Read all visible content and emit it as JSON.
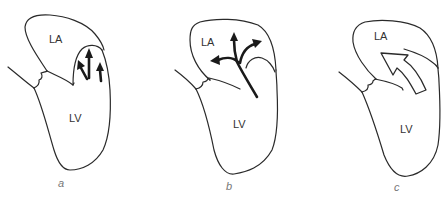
{
  "figure": {
    "panels": [
      {
        "id": "a",
        "panel_label": "a",
        "chamber_labels": {
          "atrium": "LA",
          "ventricle": "LV"
        },
        "flow_depiction": "three short arrows in regurgitant pocket"
      },
      {
        "id": "b",
        "panel_label": "b",
        "chamber_labels": {
          "atrium": "LA",
          "ventricle": "LV"
        },
        "flow_depiction": "branching jet with three arrowheads"
      },
      {
        "id": "c",
        "panel_label": "c",
        "chamber_labels": {
          "atrium": "LA",
          "ventricle": "LV"
        },
        "flow_depiction": "large hollow curved arrow"
      }
    ],
    "colors": {
      "line": "#2a2a2a",
      "label_text": "#333333",
      "panel_label_text": "#777777",
      "background": "#ffffff"
    }
  }
}
